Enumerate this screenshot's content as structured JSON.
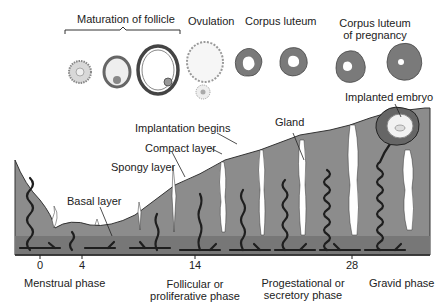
{
  "diagram": {
    "ovary_stages": {
      "maturation_label": "Maturation of follicle",
      "ovulation_label": "Ovulation",
      "corpus_luteum_label": "Corpus luteum",
      "corpus_luteum_pregnancy_label_line1": "Corpus luteum",
      "corpus_luteum_pregnancy_label_line2": "of pregnancy"
    },
    "endometrium_labels": {
      "implantation_begins": "Implantation begins",
      "compact_layer": "Compact layer",
      "spongy_layer": "Spongy layer",
      "basal_layer": "Basal layer",
      "gland": "Gland",
      "implanted_embryo": "Implanted embryo"
    },
    "day_axis": {
      "ticks": [
        "0",
        "4",
        "14",
        "28"
      ]
    },
    "phases": {
      "menstrual": "Menstrual phase",
      "follicular_line1": "Follicular or",
      "follicular_line2": "proliferative phase",
      "progestational_line1": "Progestational or",
      "progestational_line2": "secretory phase",
      "gravid": "Gravid phase"
    },
    "colors": {
      "tissue": "#8c8c8c",
      "basal": "#777777",
      "vessel": "#1e1e1e",
      "gland": "#ffffff",
      "corpus": "#7a7a7a"
    }
  }
}
